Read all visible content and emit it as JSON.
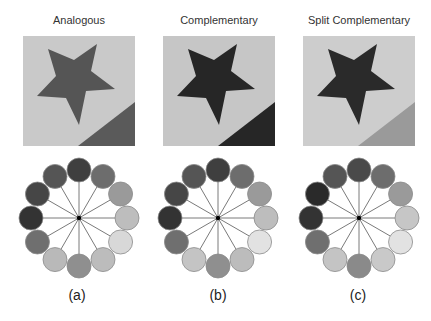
{
  "figure": {
    "panels": [
      {
        "id": "a",
        "title": "Analogous",
        "label": "(a)",
        "background_color": "#c9c9c9",
        "star_color": "#555555",
        "corner_color": "#5a5a5a",
        "wheel_colors": [
          "#3f3f3f",
          "#6d6d6d",
          "#9a9a9a",
          "#bdbdbd",
          "#d8d8d8",
          "#bcbcbc",
          "#8f8f8f",
          "#b9b9b9",
          "#6f6f6f",
          "#333333",
          "#464646",
          "#555555"
        ]
      },
      {
        "id": "b",
        "title": "Complementary",
        "label": "(b)",
        "background_color": "#c6c6c6",
        "star_color": "#262626",
        "corner_color": "#262626",
        "wheel_colors": [
          "#3f3f3f",
          "#6d6d6d",
          "#9a9a9a",
          "#bdbdbd",
          "#e2e2e2",
          "#bcbcbc",
          "#8f8f8f",
          "#c4c4c4",
          "#6f6f6f",
          "#333333",
          "#464646",
          "#555555"
        ]
      },
      {
        "id": "c",
        "title": "Split Complementary",
        "label": "(c)",
        "background_color": "#cdcdcd",
        "star_color": "#2a2a2a",
        "corner_color": "#9a9a9a",
        "wheel_colors": [
          "#4a4a4a",
          "#6d6d6d",
          "#9a9a9a",
          "#c6c6c6",
          "#e2e2e2",
          "#c9c9c9",
          "#8a8a8a",
          "#c4c4c4",
          "#6f6f6f",
          "#333333",
          "#2a2a2a",
          "#555555"
        ]
      }
    ],
    "wheel": {
      "segments": 12,
      "ring_radius": 48,
      "swatch_radius": 12,
      "spoke_color": "#7a7a7a",
      "hub_color": "#000000"
    }
  }
}
